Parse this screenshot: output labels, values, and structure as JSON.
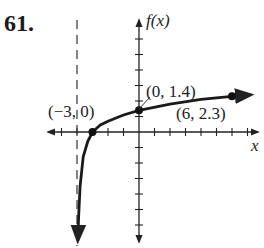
{
  "problem": {
    "number": "61."
  },
  "chart_data": {
    "type": "line",
    "title": "",
    "xlabel": "x",
    "ylabel": "f(x)",
    "xlim": [
      -6,
      7.5
    ],
    "ylim": [
      -7,
      7
    ],
    "grid": false,
    "tick_spacing": 1,
    "asymptote": {
      "type": "vertical",
      "x": -4,
      "style": "dashed"
    },
    "points": [
      {
        "x": -3,
        "y": 0,
        "label": "(−3, 0)"
      },
      {
        "x": 0,
        "y": 1.4,
        "label": "(0, 1.4)"
      },
      {
        "x": 6,
        "y": 2.3,
        "label": "(6, 2.3)"
      }
    ],
    "curve": {
      "description": "logarithmic-like curve, increasing, vertical asymptote at x = -4, arrows at both ends",
      "x": [
        -3.95,
        -3.9,
        -3.8,
        -3.6,
        -3.3,
        -3,
        -2.5,
        -2,
        -1,
        0,
        2,
        4,
        6,
        7.2
      ],
      "y": [
        -7,
        -5.5,
        -3.5,
        -1.6,
        -0.6,
        0,
        0.45,
        0.7,
        1.1,
        1.4,
        1.8,
        2.1,
        2.3,
        2.4
      ]
    },
    "labels": {
      "x_axis": "x",
      "y_axis": "f(x)"
    }
  }
}
